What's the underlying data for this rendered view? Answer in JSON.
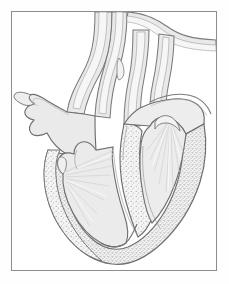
{
  "figure": {
    "kind": "anatomical-line-illustration",
    "caption": "",
    "frame": {
      "visible": true,
      "border_color": "#8d8d8d",
      "background": "#ffffff"
    }
  },
  "palette": {
    "background": "#ffffff",
    "frame_line": "#8d8d8d",
    "outline_dark": "#6f6f6f",
    "outline_mid": "#9a9a9a",
    "chamber_fill": "#ededed",
    "lumen_fill": "#f4f4f4",
    "vessel_wall_fill": "#e4e4e4",
    "myocardium_stipple_dot": "#9e9e9e",
    "myocardium_stipple_base": "#f2f2f2",
    "chordae_line": "#d8d8d8",
    "highlight_white": "#ffffff"
  },
  "structures": [
    {
      "id": "aortic-arch",
      "label": "aortic arch",
      "region": "superior",
      "fill": "lumen"
    },
    {
      "id": "ascending-aorta",
      "label": "ascending aorta",
      "region": "superior",
      "fill": "lumen"
    },
    {
      "id": "pulmonary-trunk",
      "label": "pulmonary trunk",
      "region": "superior",
      "fill": "lumen"
    },
    {
      "id": "superior-vena-cava",
      "label": "superior vena cava",
      "region": "superior-left",
      "fill": "lumen"
    },
    {
      "id": "brachiocephalic",
      "label": "brachiocephalic branch",
      "region": "superior-mid",
      "fill": "lumen"
    },
    {
      "id": "left-atrium",
      "label": "left atrium",
      "region": "upper-left",
      "fill": "chamber"
    },
    {
      "id": "right-atrium",
      "label": "right atrium",
      "region": "upper-right",
      "fill": "chamber"
    },
    {
      "id": "atrial-appendage",
      "label": "atrial appendage",
      "region": "left-margin",
      "fill": "chamber"
    },
    {
      "id": "interventricular-septum",
      "label": "interventricular septum",
      "region": "center",
      "fill": "stipple"
    },
    {
      "id": "left-ventricle",
      "label": "left ventricle cavity",
      "region": "lower-left",
      "fill": "chamber"
    },
    {
      "id": "right-ventricle",
      "label": "right ventricle cavity",
      "region": "lower-right",
      "fill": "chamber"
    },
    {
      "id": "myocardium",
      "label": "myocardial wall (stippled)",
      "region": "outer",
      "fill": "stipple"
    },
    {
      "id": "papillary-muscle-left",
      "label": "papillary muscle",
      "region": "lower-left",
      "fill": "chamber"
    },
    {
      "id": "papillary-muscle-right",
      "label": "papillary muscle",
      "region": "lower-right",
      "fill": "chamber"
    },
    {
      "id": "chordae-tendineae-left",
      "label": "chordae tendineae",
      "region": "lower-left",
      "fill": "line"
    },
    {
      "id": "chordae-tendineae-right",
      "label": "chordae tendineae",
      "region": "lower-right",
      "fill": "line"
    },
    {
      "id": "apex",
      "label": "cardiac apex",
      "region": "inferior",
      "fill": "stipple"
    }
  ]
}
